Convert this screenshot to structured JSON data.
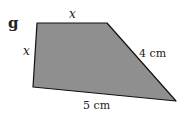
{
  "figure": {
    "label": "g",
    "shape": "quadrilateral",
    "fill_color": "#8f8f8f",
    "stroke_color": "#111111",
    "vertices": [
      [
        37,
        23
      ],
      [
        107,
        23
      ],
      [
        176,
        101
      ],
      [
        33,
        87
      ]
    ],
    "sides": {
      "top": "x",
      "left": "x",
      "right": "4 cm",
      "bottom": "5 cm"
    }
  }
}
